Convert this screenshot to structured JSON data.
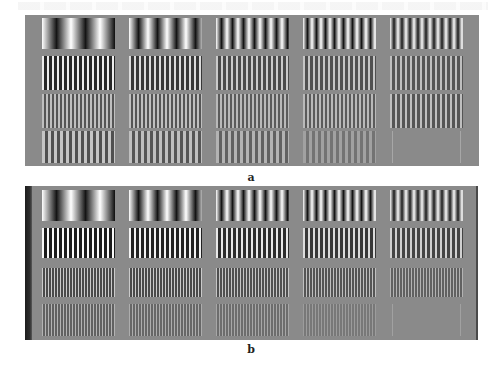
{
  "figure": {
    "background_grey": "#8a8a8a",
    "columns": 5,
    "rows": 4,
    "panels": [
      {
        "id": "a",
        "caption": "a",
        "tile_rows": [
          {
            "periods_px": [
              29,
              19,
              11,
              9,
              8
            ],
            "contrast": [
              1.0,
              1.0,
              1.0,
              1.0,
              0.95
            ],
            "smooth": true
          },
          {
            "periods_px": [
              5,
              5,
              5,
              5,
              5
            ],
            "contrast": [
              0.85,
              0.7,
              0.55,
              0.5,
              0.45
            ],
            "smooth": false
          },
          {
            "periods_px": [
              4,
              4,
              4,
              4,
              5
            ],
            "contrast": [
              0.45,
              0.45,
              0.4,
              0.4,
              0.45
            ],
            "smooth": false
          },
          {
            "periods_px": [
              6,
              6,
              6,
              6,
              70
            ],
            "contrast": [
              0.5,
              0.45,
              0.35,
              0.2,
              0.25
            ],
            "smooth": false
          }
        ]
      },
      {
        "id": "b",
        "caption": "b",
        "tile_rows": [
          {
            "periods_px": [
              29,
              19,
              11,
              9,
              8
            ],
            "contrast": [
              1.0,
              1.0,
              1.0,
              1.0,
              0.95
            ],
            "smooth": true
          },
          {
            "periods_px": [
              5,
              5,
              5,
              5,
              5
            ],
            "contrast": [
              0.95,
              0.9,
              0.8,
              0.7,
              0.6
            ],
            "smooth": false
          },
          {
            "periods_px": [
              3,
              3,
              3,
              3,
              3
            ],
            "contrast": [
              0.55,
              0.55,
              0.5,
              0.45,
              0.35
            ],
            "smooth": false
          },
          {
            "periods_px": [
              3,
              3,
              3,
              3,
              70
            ],
            "contrast": [
              0.35,
              0.3,
              0.25,
              0.15,
              0.2
            ],
            "smooth": false
          }
        ]
      }
    ]
  }
}
